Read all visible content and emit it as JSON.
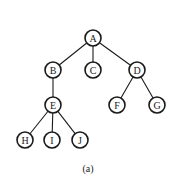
{
  "diagram": {
    "type": "tree",
    "caption": "(a)",
    "nodes": [
      {
        "id": "A",
        "label": "A",
        "x": 93,
        "y": 38
      },
      {
        "id": "B",
        "label": "B",
        "x": 53,
        "y": 70
      },
      {
        "id": "C",
        "label": "C",
        "x": 93,
        "y": 70
      },
      {
        "id": "D",
        "label": "D",
        "x": 137,
        "y": 70
      },
      {
        "id": "E",
        "label": "E",
        "x": 53,
        "y": 105
      },
      {
        "id": "F",
        "label": "F",
        "x": 117,
        "y": 105
      },
      {
        "id": "G",
        "label": "G",
        "x": 157,
        "y": 105
      },
      {
        "id": "H",
        "label": "H",
        "x": 25,
        "y": 140
      },
      {
        "id": "I",
        "label": "I",
        "x": 52,
        "y": 140
      },
      {
        "id": "J",
        "label": "J",
        "x": 80,
        "y": 140
      }
    ],
    "edges": [
      [
        "A",
        "B"
      ],
      [
        "A",
        "C"
      ],
      [
        "A",
        "D"
      ],
      [
        "B",
        "E"
      ],
      [
        "D",
        "F"
      ],
      [
        "D",
        "G"
      ],
      [
        "E",
        "H"
      ],
      [
        "E",
        "I"
      ],
      [
        "E",
        "J"
      ]
    ]
  }
}
